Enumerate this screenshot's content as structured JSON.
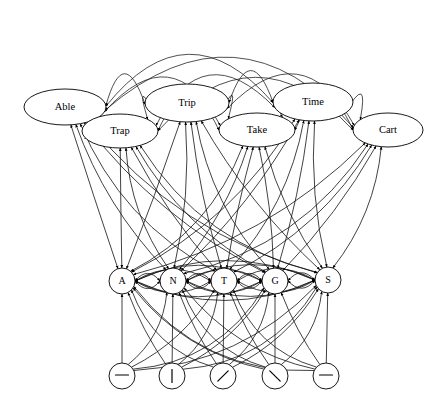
{
  "diagram": {
    "type": "layered-node-graph",
    "background_color": "#ffffff",
    "line_color": "#111111",
    "node_fill": "#ffffff",
    "node_stroke": "#000000",
    "layers": [
      {
        "name": "word-layer",
        "shape": "ellipse",
        "nodes": [
          {
            "id": "able",
            "label": "Able",
            "cx": 65,
            "cy": 107,
            "rx": 41,
            "ry": 18
          },
          {
            "id": "trap",
            "label": "Trap",
            "cx": 120,
            "cy": 131,
            "rx": 38,
            "ry": 17
          },
          {
            "id": "trip",
            "label": "Trip",
            "cx": 187,
            "cy": 103,
            "rx": 42,
            "ry": 19
          },
          {
            "id": "take",
            "label": "Take",
            "cx": 257,
            "cy": 130,
            "rx": 38,
            "ry": 17
          },
          {
            "id": "time",
            "label": "Time",
            "cx": 313,
            "cy": 102,
            "rx": 40,
            "ry": 19
          },
          {
            "id": "cart",
            "label": "Cart",
            "cx": 388,
            "cy": 130,
            "rx": 35,
            "ry": 17
          }
        ]
      },
      {
        "name": "letter-layer",
        "shape": "circle",
        "nodes": [
          {
            "id": "letter-a",
            "label": "A",
            "cx": 122,
            "cy": 281,
            "r": 13
          },
          {
            "id": "letter-n",
            "label": "N",
            "cx": 173,
            "cy": 281,
            "r": 13
          },
          {
            "id": "letter-t",
            "label": "T",
            "cx": 224,
            "cy": 281,
            "r": 13
          },
          {
            "id": "letter-g",
            "label": "G",
            "cx": 275,
            "cy": 281,
            "r": 13
          },
          {
            "id": "letter-s",
            "label": "S",
            "cx": 328,
            "cy": 280,
            "r": 13
          }
        ]
      },
      {
        "name": "feature-layer",
        "shape": "circle",
        "nodes": [
          {
            "id": "feat-horiz-1",
            "glyph": "horizontal-bar",
            "cx": 122,
            "cy": 376,
            "r": 13
          },
          {
            "id": "feat-vert",
            "glyph": "vertical-bar",
            "cx": 172,
            "cy": 376,
            "r": 13
          },
          {
            "id": "feat-slash",
            "glyph": "forward-slash",
            "cx": 223,
            "cy": 376,
            "r": 13
          },
          {
            "id": "feat-backslash",
            "glyph": "back-slash",
            "cx": 275,
            "cy": 376,
            "r": 13
          },
          {
            "id": "feat-horiz-2",
            "glyph": "horizontal-bar",
            "cx": 326,
            "cy": 376,
            "r": 13
          }
        ]
      }
    ]
  }
}
